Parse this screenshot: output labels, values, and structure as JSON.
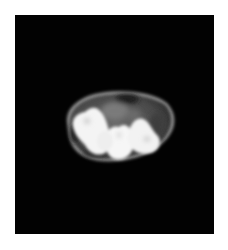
{
  "image": {
    "kind": "ct-cross-section",
    "background_color": "#ffffff",
    "frame_color": "#020202",
    "colors": {
      "soft_tissue": "#4a4a4a",
      "soft_tissue_light": "#6e6e6e",
      "skin_rim": "#8a8a8a",
      "bone": "#f4f4f4"
    }
  }
}
